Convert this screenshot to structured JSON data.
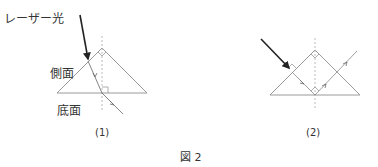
{
  "figure": {
    "caption": "図 2",
    "panels": [
      {
        "id": "1",
        "label": "(1)",
        "annotations": {
          "laser": "レーザー光",
          "side_face": "側面",
          "bottom_face": "底面"
        }
      },
      {
        "id": "2",
        "label": "(2)"
      }
    ]
  }
}
